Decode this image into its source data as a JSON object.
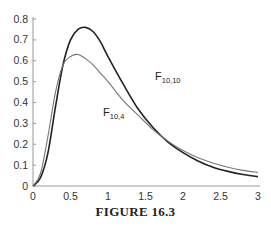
{
  "caption": "FIGURE 16.3",
  "chart_data": {
    "type": "line",
    "title": "",
    "xlabel": "",
    "ylabel": "",
    "xlim": [
      0,
      3
    ],
    "ylim": [
      0,
      0.8
    ],
    "grid": false,
    "x_ticks": [
      "0",
      "0.5",
      "1",
      "1.5",
      "2",
      "2.5",
      "3"
    ],
    "y_ticks": [
      "0",
      "0.1",
      "0.2",
      "0.3",
      "0.4",
      "0.5",
      "0.6",
      "0.7",
      "0.8"
    ],
    "series": [
      {
        "name": "F10,10",
        "label_main": "F",
        "label_sub": "10,10",
        "color": "#222222",
        "x": [
          0,
          0.1,
          0.2,
          0.3,
          0.4,
          0.5,
          0.6,
          0.7,
          0.8,
          0.9,
          1.0,
          1.2,
          1.4,
          1.6,
          1.8,
          2.0,
          2.2,
          2.4,
          2.6,
          2.8,
          3.0
        ],
        "y": [
          0,
          0.04,
          0.16,
          0.38,
          0.58,
          0.7,
          0.75,
          0.76,
          0.74,
          0.69,
          0.62,
          0.49,
          0.37,
          0.28,
          0.21,
          0.16,
          0.12,
          0.09,
          0.07,
          0.055,
          0.045
        ]
      },
      {
        "name": "F10,4",
        "label_main": "F",
        "label_sub": "10,4",
        "color": "#777777",
        "x": [
          0,
          0.1,
          0.2,
          0.3,
          0.4,
          0.5,
          0.6,
          0.7,
          0.8,
          0.9,
          1.0,
          1.2,
          1.4,
          1.6,
          1.8,
          2.0,
          2.2,
          2.4,
          2.6,
          2.8,
          3.0
        ],
        "y": [
          0,
          0.06,
          0.24,
          0.45,
          0.58,
          0.62,
          0.63,
          0.61,
          0.58,
          0.54,
          0.5,
          0.41,
          0.34,
          0.27,
          0.215,
          0.17,
          0.135,
          0.11,
          0.09,
          0.075,
          0.065
        ]
      }
    ],
    "annotations": [
      {
        "text": "F10,10",
        "x": 1.65,
        "y": 0.44
      },
      {
        "text": "F10,4",
        "x": 1.0,
        "y": 0.27
      }
    ]
  }
}
